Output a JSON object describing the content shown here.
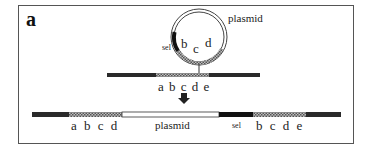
{
  "figure": {
    "panel_label": "a",
    "plasmid_label": "plasmid",
    "sel_label": "sel",
    "plasmid_insert_letters": [
      "b",
      "c",
      "d"
    ],
    "chromosome_letters": "a b c d e",
    "result": {
      "left_letters": "a b c d",
      "middle_label": "plasmid",
      "sel_label": "sel",
      "right_letters": "b c d e"
    },
    "arrow": "down-arrow"
  },
  "colors": {
    "dark_segment": "#2a2a2a",
    "homology_segment": "#8a8a8a",
    "plasmid_segment": "#ffffff",
    "sel_segment": "#111111",
    "frame": "#555555"
  }
}
